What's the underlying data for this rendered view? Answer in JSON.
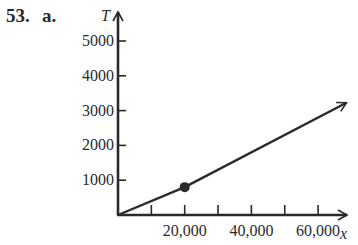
{
  "problem": {
    "number": "53.",
    "part": "a."
  },
  "chart_data": {
    "type": "line",
    "title": "",
    "xlabel": "x",
    "ylabel": "T",
    "xlim": [
      0,
      70000
    ],
    "ylim": [
      0,
      5500
    ],
    "x_ticks": [
      10000,
      20000,
      30000,
      40000,
      50000,
      60000
    ],
    "x_tick_labels": [
      {
        "value": 20000,
        "label": "20,000"
      },
      {
        "value": 40000,
        "label": "40,000"
      },
      {
        "value": 60000,
        "label": "60,000"
      }
    ],
    "y_ticks": [
      1000,
      2000,
      3000,
      4000,
      5000
    ],
    "y_tick_labels": [
      {
        "value": 1000,
        "label": "1000"
      },
      {
        "value": 2000,
        "label": "2000"
      },
      {
        "value": 3000,
        "label": "3000"
      },
      {
        "value": 4000,
        "label": "4000"
      },
      {
        "value": 5000,
        "label": "5000"
      }
    ],
    "grid": false,
    "legend": null,
    "series": [
      {
        "name": "T(x)",
        "x": [
          0,
          20000,
          68500
        ],
        "values": [
          0,
          800,
          3225
        ],
        "end_arrow": true
      }
    ],
    "points": [
      {
        "x": 20000,
        "y": 800,
        "style": "filled-dot"
      }
    ]
  }
}
